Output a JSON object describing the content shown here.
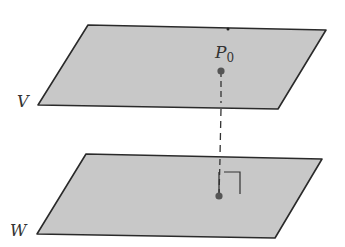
{
  "diagram": {
    "type": "geometry",
    "colors": {
      "plane_fill": "#c8c8c8",
      "plane_stroke": "#2a2a2a",
      "point": "#555555",
      "label": "#333333"
    },
    "planes": [
      {
        "id": "V",
        "label": "V",
        "points": [
          [
            88,
            25
          ],
          [
            326,
            30
          ],
          [
            278,
            109
          ],
          [
            38,
            105
          ]
        ]
      },
      {
        "id": "W",
        "label": "W",
        "points": [
          [
            86,
            154
          ],
          [
            322,
            159
          ],
          [
            275,
            238
          ],
          [
            37,
            234
          ]
        ]
      }
    ],
    "point_P0": {
      "label_main": "P",
      "label_sub": "0",
      "x": 221,
      "y": 71
    },
    "foot_point": {
      "x": 219,
      "y": 196
    },
    "top_edge_mark": {
      "x": 228,
      "y": 29
    },
    "right_angle_mark": {
      "x": 222,
      "y": 172,
      "size": 18
    }
  }
}
